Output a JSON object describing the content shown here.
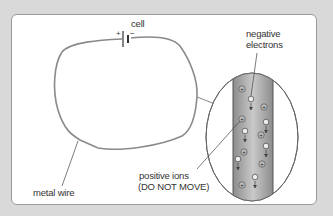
{
  "labels": {
    "cell": "cell",
    "cell_plus": "+",
    "cell_minus": "−",
    "negative_electrons_line1": "negative",
    "negative_electrons_line2": "electrons",
    "positive_ions_line1": "positive ions",
    "positive_ions_line2": "(DO NOT MOVE)",
    "metal_wire": "metal wire"
  },
  "colors": {
    "background": "#d9d9d9",
    "panel": "#ffffff",
    "wire": "#8a8a8a",
    "text": "#333333"
  }
}
